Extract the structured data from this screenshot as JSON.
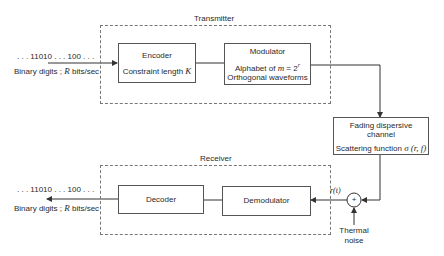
{
  "transmitter": {
    "label": "Transmitter",
    "input_bits": ". . . 11010 . . . 100 . . .",
    "input_rate_prefix": "Binary digits ; ",
    "input_rate_var": "R",
    "input_rate_suffix": " bits/sec",
    "encoder": {
      "title": "Encoder",
      "line2_prefix": "Constraint length ",
      "line2_var": "K"
    },
    "modulator": {
      "title": "Modulator",
      "line2_prefix": "Alphabet of ",
      "line2_var": "m",
      "line2_eq": " = 2",
      "line2_exp": "r",
      "line3": "Orthogonal waveforms"
    }
  },
  "channel": {
    "line1": "Fading dispersive",
    "line2": "channel",
    "line3_prefix": "Scattering function ",
    "line3_func": "σ (r, f)"
  },
  "receiver": {
    "label": "Receiver",
    "output_bits": ". . . 11010 . . . 100 . . .",
    "output_rate_prefix": "Binary digits ; ",
    "output_rate_var": "R",
    "output_rate_suffix": " bits/sec",
    "decoder": {
      "title": "Decoder"
    },
    "demodulator": {
      "title": "Demodulator"
    },
    "received_signal": "r(t)",
    "summer_symbol": "+",
    "noise_line1": "Thermal",
    "noise_line2": "noise"
  }
}
